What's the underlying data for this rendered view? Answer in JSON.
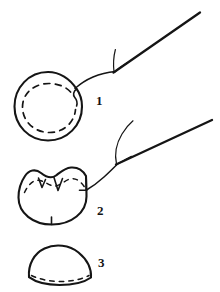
{
  "figure": {
    "background_color": "#ffffff",
    "ink_color": "#151515",
    "width": 220,
    "height": 292,
    "style": "black and white line drawing"
  },
  "steps": [
    {
      "number": "1",
      "name": "purse-string-suture-placed",
      "description": "Circular wound with running purse-string suture shown as dashed line just inside the wound margin; suture tail exits at upper right and leads to a straight needle.",
      "elements": [
        "wound-outline-circle",
        "dashed-purse-string-suture",
        "suture-thread",
        "straight-needle"
      ]
    },
    {
      "number": "2",
      "name": "purse-string-suture-cinched",
      "description": "Suture drawn tight; wound margin gathers into puckered scalloped folds along the upper edge with V-shaped notches. Thread still attached to needle at right.",
      "elements": [
        "gathered-wound-outline",
        "dashed-suture-under-folds",
        "pucker-notches",
        "suture-thread",
        "straight-needle"
      ]
    },
    {
      "number": "3",
      "name": "closure-complete",
      "description": "Final result: wound closed into a dome / half-moon shape with the gathered suture line as short dashes along the flat base.",
      "elements": [
        "dome-outline",
        "dashed-closure-line"
      ]
    }
  ],
  "labels": {
    "step_one": "1",
    "step_two": "2",
    "step_three": "3"
  }
}
